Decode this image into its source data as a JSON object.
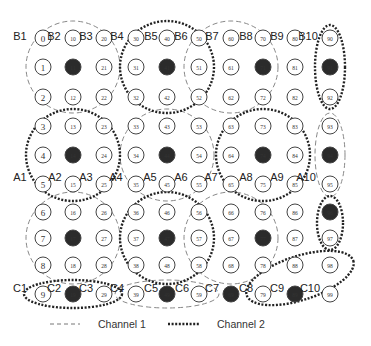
{
  "diagram": {
    "grid": {
      "col_x": [
        43,
        73,
        104,
        136,
        167,
        199,
        231,
        263,
        295,
        330
      ],
      "row_y": [
        38,
        67,
        97,
        126,
        155,
        184,
        212,
        238,
        265,
        294
      ],
      "filled_nodes": [
        11,
        14,
        17,
        19,
        41,
        44,
        47,
        49,
        69,
        71,
        74,
        77,
        89,
        91,
        94,
        96
      ]
    },
    "region_labels": [
      {
        "text": "B1",
        "x": 20,
        "y": 40
      },
      {
        "text": "B2",
        "x": 54,
        "y": 40
      },
      {
        "text": "B3",
        "x": 86,
        "y": 40
      },
      {
        "text": "B4",
        "x": 117,
        "y": 40
      },
      {
        "text": "B5",
        "x": 151,
        "y": 40
      },
      {
        "text": "B6",
        "x": 181,
        "y": 40
      },
      {
        "text": "B7",
        "x": 212,
        "y": 40
      },
      {
        "text": "B8",
        "x": 246,
        "y": 40
      },
      {
        "text": "B9",
        "x": 277,
        "y": 40
      },
      {
        "text": "B10",
        "x": 308,
        "y": 40
      },
      {
        "text": "A1",
        "x": 20,
        "y": 181
      },
      {
        "text": "A2",
        "x": 55,
        "y": 181
      },
      {
        "text": "A3",
        "x": 86,
        "y": 181
      },
      {
        "text": "A4",
        "x": 116,
        "y": 181
      },
      {
        "text": "A5",
        "x": 150,
        "y": 181
      },
      {
        "text": "A6",
        "x": 181,
        "y": 181
      },
      {
        "text": "A7",
        "x": 211,
        "y": 181
      },
      {
        "text": "A8",
        "x": 246,
        "y": 181
      },
      {
        "text": "A9",
        "x": 277,
        "y": 181
      },
      {
        "text": "A10",
        "x": 306,
        "y": 181
      },
      {
        "text": "C1",
        "x": 20,
        "y": 292
      },
      {
        "text": "C2",
        "x": 54,
        "y": 292
      },
      {
        "text": "C3",
        "x": 86,
        "y": 292
      },
      {
        "text": "C4",
        "x": 117,
        "y": 292
      },
      {
        "text": "C5",
        "x": 151,
        "y": 292
      },
      {
        "text": "C6",
        "x": 182,
        "y": 292
      },
      {
        "text": "C7",
        "x": 212,
        "y": 292
      },
      {
        "text": "C8",
        "x": 246,
        "y": 292
      },
      {
        "text": "C9",
        "x": 277,
        "y": 292
      },
      {
        "text": "C10",
        "x": 310,
        "y": 292
      }
    ],
    "channel1_ellipses": [
      {
        "cx": 73,
        "cy": 67,
        "rx": 47,
        "ry": 46
      },
      {
        "cx": 231,
        "cy": 67,
        "rx": 47,
        "ry": 46
      },
      {
        "cx": 167,
        "cy": 155,
        "rx": 47,
        "ry": 46
      },
      {
        "cx": 330,
        "cy": 155,
        "rx": 15,
        "ry": 42
      },
      {
        "cx": 73,
        "cy": 238,
        "rx": 47,
        "ry": 46
      },
      {
        "cx": 231,
        "cy": 238,
        "rx": 47,
        "ry": 46
      },
      {
        "cx": 167,
        "cy": 294,
        "rx": 52,
        "ry": 14
      }
    ],
    "channel2_ellipses": [
      {
        "cx": 167,
        "cy": 67,
        "rx": 47,
        "ry": 46
      },
      {
        "cx": 330,
        "cy": 67,
        "rx": 15,
        "ry": 42
      },
      {
        "cx": 73,
        "cy": 155,
        "rx": 47,
        "ry": 46
      },
      {
        "cx": 263,
        "cy": 155,
        "rx": 47,
        "ry": 46
      },
      {
        "cx": 167,
        "cy": 238,
        "rx": 47,
        "ry": 46
      },
      {
        "cx": 330,
        "cy": 223,
        "rx": 13,
        "ry": 27
      },
      {
        "cx": 73,
        "cy": 294,
        "rx": 49,
        "ry": 14
      },
      {
        "cx": 300,
        "cy": 278,
        "rx": 56,
        "ry": 22,
        "rotate": -18
      }
    ],
    "legend": {
      "channel1_label": "Channel 1",
      "channel2_label": "Channel 2"
    }
  }
}
